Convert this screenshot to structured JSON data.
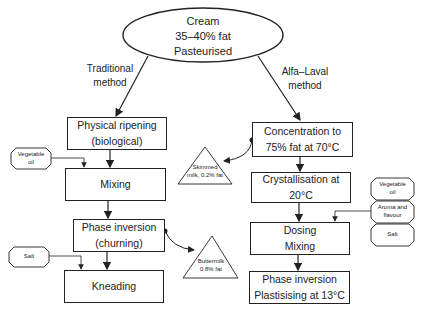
{
  "source": {
    "lines": [
      "Cream",
      "35–40% fat",
      "Pasteurised"
    ]
  },
  "branches": {
    "traditional": {
      "lines": [
        "Traditional",
        "method"
      ]
    },
    "alfa_laval": {
      "lines": [
        "Alfa–Laval",
        "method"
      ]
    }
  },
  "traditional_steps": [
    {
      "lines": [
        "Physical ripening",
        "(biological)"
      ]
    },
    {
      "lines": [
        "Mixing"
      ]
    },
    {
      "lines": [
        "Phase inversion",
        "(churning)"
      ]
    },
    {
      "lines": [
        "Kneading"
      ]
    }
  ],
  "alfa_steps": [
    {
      "lines": [
        "Concentration to",
        "75% fat at 70°C"
      ]
    },
    {
      "lines": [
        "Crystallisation at 20°C"
      ]
    },
    {
      "lines": [
        "Dosing",
        "Mixing"
      ]
    },
    {
      "lines": [
        "Phase inversion",
        "Plastisising at 13°C"
      ]
    }
  ],
  "inputs": {
    "left_oil": {
      "lines": [
        "Vegetable",
        "oil"
      ]
    },
    "left_salt": {
      "lines": [
        "Salt"
      ]
    },
    "right_oil": {
      "lines": [
        "Vegetable",
        "oil"
      ]
    },
    "right_aroma": {
      "lines": [
        "Aroma and",
        "flavour"
      ]
    },
    "right_salt": {
      "lines": [
        "Salt"
      ]
    }
  },
  "outputs": {
    "skimmed": {
      "lines": [
        "Skimmed",
        "milk, 0.2% fat"
      ]
    },
    "buttermilk": {
      "lines": [
        "Buttermilk",
        "0.8% fat"
      ]
    }
  }
}
